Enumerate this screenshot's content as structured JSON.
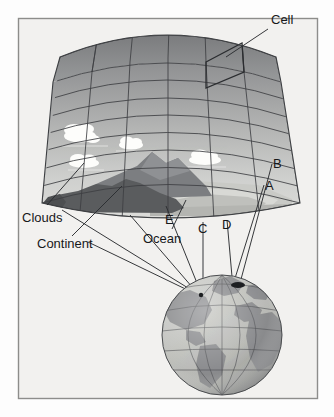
{
  "figure": {
    "background_color": "#f2f1ef",
    "border_color": "#8d8d8b",
    "page_color": "#fdfdfd"
  },
  "labels": {
    "cell": "Cell",
    "clouds": "Clouds",
    "continent": "Continent",
    "ocean": "Ocean",
    "a": "A",
    "b": "B",
    "c": "C",
    "d": "D",
    "e": "E"
  },
  "diagram": {
    "grid_block": {
      "name": "atmospheric-grid-column",
      "columns": 6,
      "layers": 8,
      "top_face_color": "#8c8c8c",
      "front_face_top_color": "#919191",
      "front_face_bottom_color": "#d7d7d5",
      "grid_line_color": "#3d3f42"
    },
    "terrain": {
      "continent_color": "#5a5c5e",
      "mountain_color": "#6f7174",
      "mountain_highlight_color": "#8e9093",
      "ocean_color": "#c9cac6",
      "ocean_shelf_color": "#b4b5b1",
      "ocean_edge_color": "#dedfdb"
    },
    "clouds": {
      "color": "#fdfdfb",
      "count": 5
    },
    "globe": {
      "name": "earth-globe",
      "center_x": 222,
      "center_y": 335,
      "radius": 60,
      "ocean_color": "#b9bab6",
      "land_color": "#88898a",
      "graticule_color": "#4a4c4f",
      "shadow_color": "#6f7073",
      "continents": [
        "North America",
        "South America",
        "Europe",
        "Africa",
        "Greenland"
      ]
    },
    "leader_lines": {
      "color": "#2b2d30",
      "count": 7
    }
  }
}
